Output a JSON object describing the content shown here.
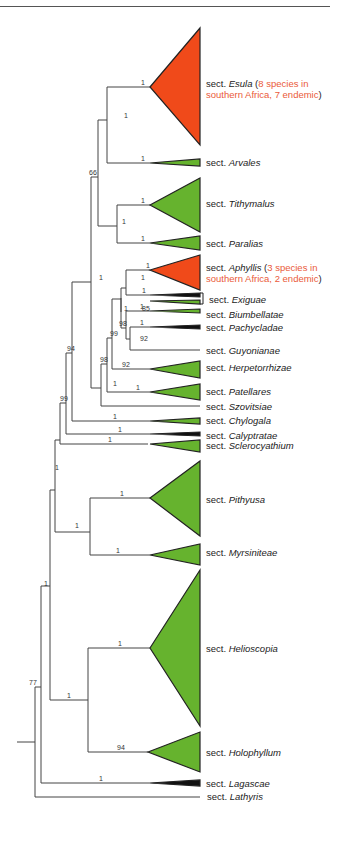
{
  "figure": {
    "type": "phylogenetic-tree",
    "colors": {
      "highlight_clade": "#f04a1a",
      "clade": "#66b32e",
      "branch": "#444444",
      "highlight_text": "#ea5a3a"
    }
  },
  "taxa": [
    {
      "prefix": "sect.",
      "name": "Esula",
      "note": "8 species in southern Africa, 7 endemic",
      "note_line1": "8 species in",
      "note_line2": "southern Africa, 7 endemic",
      "color": "red"
    },
    {
      "prefix": "sect.",
      "name": "Arvales",
      "color": "green"
    },
    {
      "prefix": "sect.",
      "name": "Tithymalus",
      "color": "green"
    },
    {
      "prefix": "sect.",
      "name": "Paralias",
      "color": "green"
    },
    {
      "prefix": "sect.",
      "name": "Aphyllis",
      "note": "3 species in southern Africa, 2 endemic",
      "note_line1": "3 species in",
      "note_line2": "southern Africa, 2 endemic",
      "color": "red"
    },
    {
      "prefix": "sect.",
      "name": "Exiguae",
      "color": "black"
    },
    {
      "prefix": "sect.",
      "name": "Biumbellatae",
      "color": "green"
    },
    {
      "prefix": "sect.",
      "name": "Pachycladae",
      "color": "black"
    },
    {
      "prefix": "sect.",
      "name": "Guyonianae",
      "color": "none"
    },
    {
      "prefix": "sect.",
      "name": "Herpetorrhizae",
      "color": "green"
    },
    {
      "prefix": "sect.",
      "name": "Patellares",
      "color": "green"
    },
    {
      "prefix": "sect.",
      "name": "Szovitsiae",
      "color": "none"
    },
    {
      "prefix": "sect.",
      "name": "Chylogala",
      "color": "green"
    },
    {
      "prefix": "sect.",
      "name": "Calyptratae",
      "color": "black"
    },
    {
      "prefix": "sect.",
      "name": "Sclerocyathium",
      "color": "green"
    },
    {
      "prefix": "sect.",
      "name": "Pithyusa",
      "color": "green"
    },
    {
      "prefix": "sect.",
      "name": "Myrsiniteae",
      "color": "green"
    },
    {
      "prefix": "sect.",
      "name": "Helioscopia",
      "color": "green"
    },
    {
      "prefix": "sect.",
      "name": "Holophyllum",
      "color": "green"
    },
    {
      "prefix": "sect.",
      "name": "Lagascae",
      "color": "black"
    },
    {
      "prefix": "sect.",
      "name": "Lathyris",
      "color": "none"
    }
  ],
  "support_values": {
    "esula": "1",
    "arvales": "1",
    "esula_arvales": "1",
    "node66": "66",
    "tithymalus": "1",
    "paralias": "1",
    "tith_paralias": "1",
    "aphyllis": "1",
    "aphyllis_exiguae": "1",
    "exiguae_a": "1",
    "exiguae_b": "85",
    "biumbellatae": "1",
    "pachycladae": "1",
    "pachy_guyon": "92",
    "biumb_group": "98",
    "node99a": "99",
    "herpetorrhizae": "92",
    "node98": "98",
    "patellares": "1",
    "node_szov": "1",
    "node_upper": "1",
    "node94": "94",
    "chylogala": "1",
    "node99b": "99",
    "calyptratae": "1",
    "sclerocyathium": "1",
    "node_big": "1",
    "pithyusa": "1",
    "myrsiniteae": "1",
    "pith_myrs": "1",
    "node_clade1": "1",
    "helioscopia": "1",
    "holophyllum": "94",
    "helio_holo": "1",
    "node_upper2": "1",
    "lagascae": "1",
    "node77": "77"
  }
}
